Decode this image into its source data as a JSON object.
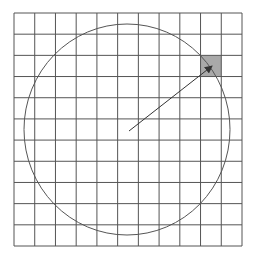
{
  "diagram": {
    "grid": {
      "columns": 11,
      "rows": 11,
      "left": 14,
      "top": 13,
      "right": 242,
      "bottom": 246,
      "line_color": "#555555"
    },
    "circle": {
      "cx": 127,
      "cy": 129.5,
      "rx": 103,
      "ry": 105.5,
      "stroke": "#555555"
    },
    "highlighted_cell": {
      "column": 9,
      "row": 2,
      "fill": "#a9a9a9"
    },
    "arrow": {
      "x1": 129,
      "y1": 131,
      "x2": 212,
      "y2": 66,
      "color": "#333333"
    }
  }
}
